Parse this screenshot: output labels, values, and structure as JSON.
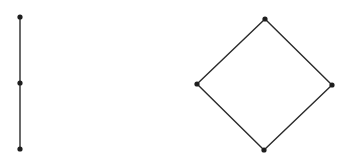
{
  "diagram": {
    "type": "hasse-diagrams",
    "colors": {
      "background": "#ffffff",
      "edge": "#2a2a2a",
      "node": "#1e1e1e"
    },
    "graphs": [
      {
        "name": "chain",
        "nodes": [
          {
            "id": "c1",
            "x": 20,
            "y": 17
          },
          {
            "id": "c2",
            "x": 20,
            "y": 83
          },
          {
            "id": "c3",
            "x": 20,
            "y": 149
          }
        ],
        "edges": [
          [
            "c1",
            "c2"
          ],
          [
            "c2",
            "c3"
          ]
        ]
      },
      {
        "name": "diamond",
        "nodes": [
          {
            "id": "d_top",
            "x": 265,
            "y": 19
          },
          {
            "id": "d_left",
            "x": 197,
            "y": 84
          },
          {
            "id": "d_right",
            "x": 332,
            "y": 85
          },
          {
            "id": "d_bottom",
            "x": 264,
            "y": 150
          }
        ],
        "edges": [
          [
            "d_top",
            "d_left"
          ],
          [
            "d_top",
            "d_right"
          ],
          [
            "d_left",
            "d_bottom"
          ],
          [
            "d_right",
            "d_bottom"
          ]
        ]
      }
    ]
  }
}
